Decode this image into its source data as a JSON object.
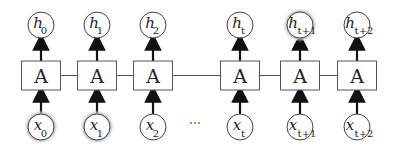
{
  "diagram": {
    "cell_label": "A",
    "ellipsis": "⋯",
    "columns": [
      {
        "x": 41,
        "h": "h",
        "h_sub": "0",
        "x_label": "x",
        "x_sub": "0",
        "h_highlight": false,
        "x_highlight": true
      },
      {
        "x": 97,
        "h": "h",
        "h_sub": "1",
        "x_label": "x",
        "x_sub": "1",
        "h_highlight": false,
        "x_highlight": true
      },
      {
        "x": 153,
        "h": "h",
        "h_sub": "2",
        "x_label": "x",
        "x_sub": "2",
        "h_highlight": false,
        "x_highlight": false
      },
      {
        "x": 240,
        "h": "h",
        "h_sub": "t",
        "x_label": "x",
        "x_sub": "t",
        "h_highlight": false,
        "x_highlight": false
      },
      {
        "x": 300,
        "h": "h",
        "h_sub": "t+1",
        "x_label": "x",
        "x_sub": "t+1",
        "h_highlight": true,
        "x_highlight": false
      },
      {
        "x": 357,
        "h": "h",
        "h_sub": "t+2",
        "x_label": "x",
        "x_sub": "t+2",
        "h_highlight": false,
        "x_highlight": false
      }
    ]
  }
}
